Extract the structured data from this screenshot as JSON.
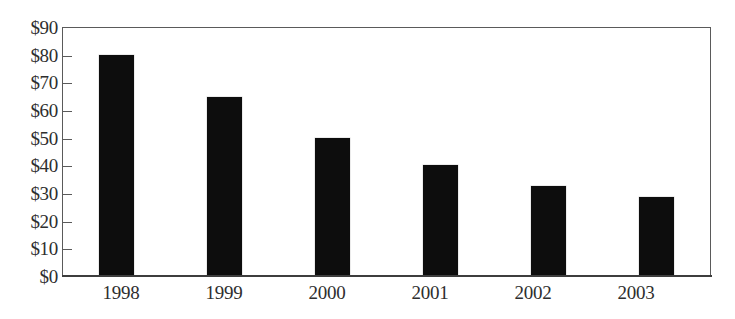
{
  "chart_data": {
    "type": "bar",
    "title": "",
    "subtitle": "",
    "xlabel": "",
    "ylabel": "",
    "categories": [
      "1998",
      "1999",
      "2000",
      "2001",
      "2002",
      "2003"
    ],
    "values": [
      80,
      65,
      50,
      40,
      32.5,
      28.5
    ],
    "series": [
      {
        "name": "",
        "values": [
          80,
          65,
          50,
          40,
          32.5,
          28.5
        ]
      }
    ],
    "ylim": [
      0,
      90
    ],
    "ytick_values": [
      0,
      10,
      20,
      30,
      40,
      50,
      60,
      70,
      80,
      90
    ],
    "ytick_labels": [
      "$0",
      "$10",
      "$20",
      "$30",
      "$40",
      "$50",
      "$60",
      "$70",
      "$80",
      "$90"
    ],
    "xtick_labels": [
      "1998",
      "1999",
      "2000",
      "2001",
      "2002",
      "2003"
    ],
    "grid": false,
    "legend": false,
    "legend_position": "none",
    "annotations": [],
    "bar_color": "#0d0d0d",
    "axis_color": "#5a5a5a",
    "label_color": "#2e2e2e",
    "background_color": "#ffffff"
  }
}
